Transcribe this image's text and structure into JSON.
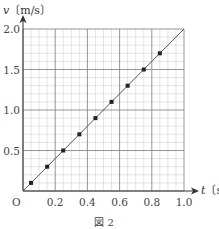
{
  "chart_data": {
    "type": "scatter",
    "title": "",
    "caption": "図 2",
    "xlabel": "t〔s〕",
    "ylabel": "v〔m/s〕",
    "xlim": [
      0,
      1.0
    ],
    "ylim": [
      0,
      2.0
    ],
    "x_ticks": [
      "0.2",
      "0.4",
      "0.6",
      "0.8",
      "1.0"
    ],
    "y_ticks": [
      "0.5",
      "1.0",
      "1.5",
      "2.0"
    ],
    "origin_label": "O",
    "grid": true,
    "grid_minor": {
      "x_step": 0.05,
      "y_step": 0.1
    },
    "grid_major": {
      "x_step": 0.2,
      "y_step": 0.5
    },
    "legend": null,
    "series": [
      {
        "name": "measured",
        "marker": "square",
        "x": [
          0.05,
          0.15,
          0.25,
          0.35,
          0.45,
          0.55,
          0.65,
          0.75,
          0.85
        ],
        "y": [
          0.1,
          0.3,
          0.5,
          0.7,
          0.9,
          1.1,
          1.3,
          1.5,
          1.7
        ]
      },
      {
        "name": "fit line",
        "type": "line",
        "x": [
          0,
          1.0
        ],
        "y": [
          0,
          2.0
        ]
      }
    ]
  },
  "labels": {
    "ylabel_v": "v",
    "ylabel_unit": "〔m/s〕",
    "xlabel_t": "t",
    "xlabel_unit": "〔s〕",
    "origin": "O",
    "caption": "図 2",
    "xticks": [
      "0.2",
      "0.4",
      "0.6",
      "0.8",
      "1.0"
    ],
    "yticks": [
      "0.5",
      "1.0",
      "1.5",
      "2.0"
    ]
  },
  "colors": {
    "axis": "#333333",
    "grid_major": "#8a8a8a",
    "grid_minor": "#c8c8c8",
    "marker": "#222222",
    "line": "#555555"
  }
}
